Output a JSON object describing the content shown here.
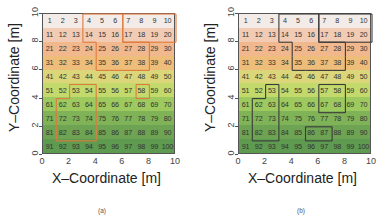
{
  "figure": {
    "panels": [
      {
        "caption": "(a)",
        "xlabel": "X–Coordinate [m]",
        "ylabel": "Y–Coordinate [m]",
        "outline_color": "#e07a3c",
        "regions": [
          {
            "cells": [
              4,
              5,
              6,
              14,
              15,
              16,
              25,
              26,
              27,
              28,
              35,
              36,
              37,
              38
            ]
          },
          {
            "cells": [
              7,
              8,
              9,
              10,
              17,
              18,
              19,
              20
            ]
          },
          {
            "cells": [
              53,
              54,
              62,
              63,
              64,
              72,
              73,
              74,
              82,
              83,
              84
            ]
          },
          {
            "cells": [
              58
            ]
          }
        ]
      },
      {
        "caption": "(b)",
        "xlabel": "X–Coordinate [m]",
        "ylabel": "Y–Coordinate [m]",
        "outline_color": "#3a3a3a",
        "regions": [
          {
            "cells": [
              4,
              5,
              6,
              14,
              15,
              16,
              25,
              26,
              27,
              28,
              35,
              36,
              37,
              38
            ]
          },
          {
            "cells": [
              7,
              8,
              9,
              10,
              17,
              18,
              19,
              20
            ]
          },
          {
            "cells": [
              53,
              62,
              63,
              72,
              73,
              82,
              83
            ]
          },
          {
            "cells": [
              57,
              58,
              67,
              68
            ]
          },
          {
            "cells": [
              86,
              87
            ]
          }
        ]
      }
    ],
    "xticks": [
      "0",
      "2",
      "4",
      "6",
      "8",
      "10"
    ],
    "yticks": [
      "0",
      "2",
      "4",
      "6",
      "8",
      "10"
    ],
    "row_colors": [
      "#f3ebe7",
      "#f2cbb4",
      "#f1b88e",
      "#edbd79",
      "#dcd67a",
      "#c3d96c",
      "#9dc95e",
      "#80b257",
      "#6fa354",
      "#5f9a51"
    ]
  },
  "chart_data": {
    "type": "heatmap",
    "title": "",
    "xlabel": "X-Coordinate [m]",
    "ylabel": "Y-Coordinate [m]",
    "xlim": [
      0,
      10
    ],
    "ylim": [
      0,
      10
    ],
    "grid": "10x10 numbered cells 1-100, row-major from top-left",
    "cells": [
      1,
      2,
      3,
      4,
      5,
      6,
      7,
      8,
      9,
      10,
      11,
      12,
      13,
      14,
      15,
      16,
      17,
      18,
      19,
      20,
      21,
      22,
      23,
      24,
      25,
      26,
      27,
      28,
      29,
      30,
      31,
      32,
      33,
      34,
      35,
      36,
      37,
      38,
      39,
      40,
      41,
      42,
      43,
      44,
      45,
      46,
      47,
      48,
      49,
      50,
      51,
      52,
      53,
      54,
      55,
      56,
      57,
      58,
      59,
      60,
      61,
      62,
      63,
      64,
      65,
      66,
      67,
      68,
      69,
      70,
      71,
      72,
      73,
      74,
      75,
      76,
      77,
      78,
      79,
      80,
      81,
      82,
      83,
      84,
      85,
      86,
      87,
      88,
      89,
      90,
      91,
      92,
      93,
      94,
      95,
      96,
      97,
      98,
      99,
      100
    ],
    "color_gradient": "top rows light pink/orange, middle yellow, bottom green",
    "panels": [
      "(a)",
      "(b)"
    ]
  }
}
